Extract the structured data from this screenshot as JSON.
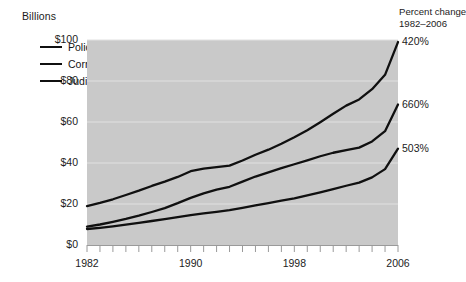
{
  "chart_data": {
    "type": "line",
    "title": "",
    "ylabel": "Billions",
    "xlabel": "",
    "ylim": [
      0,
      100
    ],
    "xlim": [
      1982,
      2006
    ],
    "grid": true,
    "legend_position": "top-left",
    "ytick_labels": [
      "$100",
      "$80",
      "$60",
      "$40",
      "$20",
      "$0"
    ],
    "ytick_values": [
      100,
      80,
      60,
      40,
      20,
      0
    ],
    "xtick_labels": [
      "1982",
      "1990",
      "1998",
      "2006"
    ],
    "xtick_values": [
      1982,
      1990,
      1998,
      2006
    ],
    "x": [
      1982,
      1983,
      1984,
      1985,
      1986,
      1987,
      1988,
      1989,
      1990,
      1991,
      1992,
      1993,
      1994,
      1995,
      1996,
      1997,
      1998,
      1999,
      2000,
      2001,
      2002,
      2003,
      2004,
      2005,
      2006
    ],
    "series": [
      {
        "name": "Police",
        "color": "#101010",
        "end_label": "420%",
        "values": [
          19.0,
          20.5,
          22.3,
          24.4,
          26.5,
          28.8,
          30.9,
          33.2,
          36.0,
          37.3,
          38.0,
          38.7,
          41.2,
          44.0,
          46.5,
          49.4,
          52.6,
          56.0,
          59.9,
          64.0,
          68.0,
          71.0,
          76.0,
          83.0,
          99.0
        ]
      },
      {
        "name": "Corrections",
        "color": "#101010",
        "end_label": "660%",
        "values": [
          9.0,
          10.0,
          11.3,
          12.7,
          14.3,
          16.1,
          18.0,
          20.4,
          23.0,
          25.2,
          27.0,
          28.4,
          30.9,
          33.4,
          35.4,
          37.5,
          39.4,
          41.3,
          43.3,
          45.0,
          46.3,
          47.5,
          50.5,
          55.5,
          68.5
        ]
      },
      {
        "name": "Judicial",
        "color": "#101010",
        "end_label": "503%",
        "values": [
          7.8,
          8.4,
          9.1,
          9.9,
          10.8,
          11.7,
          12.6,
          13.6,
          14.6,
          15.4,
          16.2,
          17.0,
          18.1,
          19.3,
          20.4,
          21.6,
          22.8,
          24.2,
          25.7,
          27.3,
          28.9,
          30.4,
          33.0,
          37.0,
          47.0
        ]
      }
    ],
    "annotation_header": [
      "Percent change",
      "1982–2006"
    ]
  },
  "legend": {
    "items": [
      {
        "label": "Police"
      },
      {
        "label": "Corrections"
      },
      {
        "label": "Judicial"
      }
    ]
  },
  "colors": {
    "plot_background": "#c9c9c9",
    "gridline": "#e2e2e2",
    "line": "#101010",
    "text": "#1c1c1c",
    "page_background": "#ffffff",
    "axis": "#9a9a9a"
  }
}
